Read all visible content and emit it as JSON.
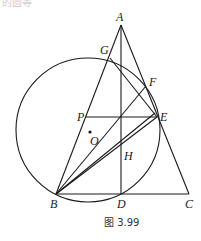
{
  "top_fragment": "的圆等",
  "caption": "图 3.99",
  "points": {
    "A": {
      "label": "A",
      "x": 121,
      "y": 25
    },
    "G": {
      "label": "G",
      "x": 110,
      "y": 58
    },
    "F": {
      "label": "F",
      "x": 146,
      "y": 86
    },
    "P": {
      "label": "P",
      "x": 86,
      "y": 117
    },
    "E": {
      "label": "E",
      "x": 157,
      "y": 117
    },
    "O": {
      "label": "O",
      "x": 90,
      "y": 132
    },
    "H": {
      "label": "H",
      "x": 121,
      "y": 150
    },
    "B": {
      "label": "B",
      "x": 56,
      "y": 194
    },
    "D": {
      "label": "D",
      "x": 121,
      "y": 194
    },
    "C": {
      "label": "C",
      "x": 189,
      "y": 194
    }
  },
  "circle": {
    "cx": 88,
    "cy": 130,
    "r": 72
  },
  "colors": {
    "stroke": "#1a1a1a",
    "background": "#ffffff"
  }
}
